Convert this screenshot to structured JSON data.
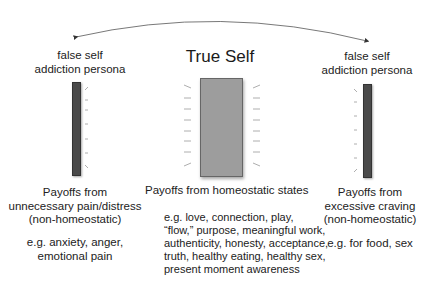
{
  "diagram": {
    "center": {
      "title": "True Self",
      "payoff_label": "Payoffs from homeostatic states",
      "examples": [
        "e.g. love, connection, play,",
        "“flow,” purpose, meaningful work,",
        "authenticity, honesty, acceptance,",
        "truth, healthy eating, healthy sex,",
        "present moment awareness"
      ],
      "bar_color": "#9d9d9d"
    },
    "left": {
      "title_line1": "false self",
      "title_line2": "addiction persona",
      "payoff_lines": [
        "Payoffs from",
        "unnecessary pain/distress",
        "(non-homeostatic)"
      ],
      "examples": [
        "e.g. anxiety, anger,",
        "emotional pain"
      ],
      "bar_color": "#4a4a4a"
    },
    "right": {
      "title_line1": "false self",
      "title_line2": "addiction persona",
      "payoff_lines": [
        "Payoffs from",
        "excessive craving",
        "(non-homeostatic)"
      ],
      "examples": [
        "e.g. for food, sex"
      ],
      "bar_color": "#4a4a4a"
    },
    "connector": "curved-double-arrow"
  }
}
